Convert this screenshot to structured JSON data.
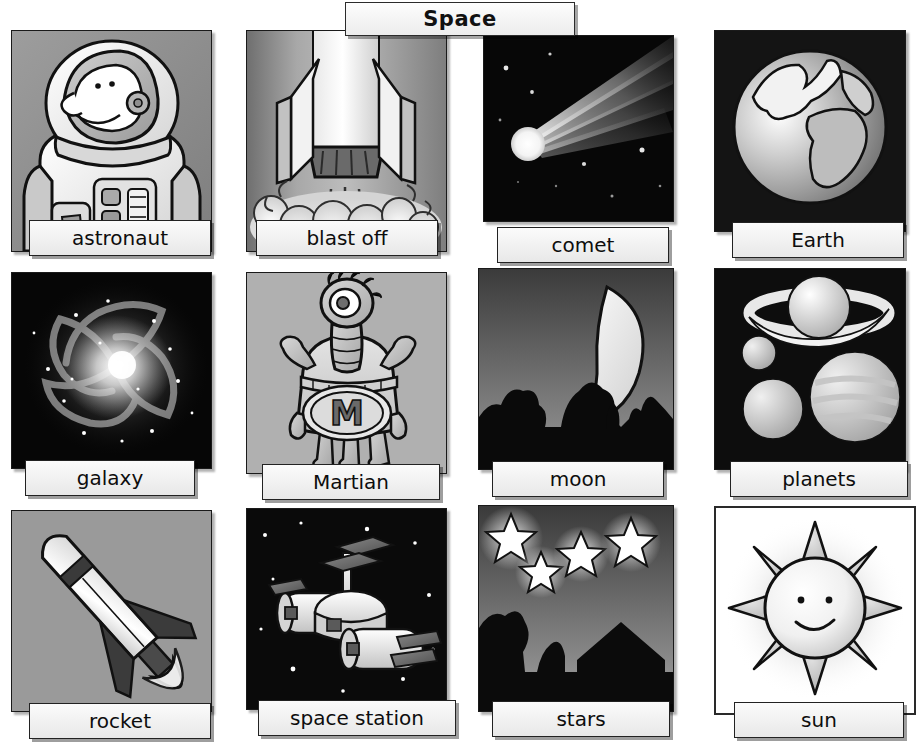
{
  "header": {
    "title": "Space"
  },
  "vocabulary": {
    "columns": 4,
    "rows": 3,
    "cards": [
      {
        "label": "astronaut",
        "icon": "astronaut-illustration",
        "background": "gray",
        "row": 1,
        "col": 1
      },
      {
        "label": "blast off",
        "icon": "rocket-launch-illustration",
        "background": "gray",
        "row": 1,
        "col": 2
      },
      {
        "label": "comet",
        "icon": "comet-photo",
        "background": "space",
        "row": 1,
        "col": 3
      },
      {
        "label": "Earth",
        "icon": "earth-globe-illustration",
        "background": "space",
        "row": 1,
        "col": 4
      },
      {
        "label": "galaxy",
        "icon": "spiral-galaxy-photo",
        "background": "space",
        "row": 2,
        "col": 1
      },
      {
        "label": "Martian",
        "icon": "martian-alien-illustration",
        "background": "gray",
        "row": 2,
        "col": 2
      },
      {
        "label": "moon",
        "icon": "crescent-moon-illustration",
        "background": "night",
        "row": 2,
        "col": 3
      },
      {
        "label": "planets",
        "icon": "planets-illustration",
        "background": "space",
        "row": 2,
        "col": 4
      },
      {
        "label": "rocket",
        "icon": "rocket-illustration",
        "background": "gray",
        "row": 3,
        "col": 1
      },
      {
        "label": "space station",
        "icon": "space-station-illustration",
        "background": "space",
        "row": 3,
        "col": 2
      },
      {
        "label": "stars",
        "icon": "stars-night-illustration",
        "background": "night",
        "row": 3,
        "col": 3
      },
      {
        "label": "sun",
        "icon": "smiling-sun-illustration",
        "background": "white",
        "row": 3,
        "col": 4
      }
    ]
  },
  "colors": {
    "label_background": "#efefef",
    "label_border": "#222222",
    "panel_border": "#1a1a1a",
    "title_background": "#f2f2f2",
    "page_background": "#ffffff"
  }
}
